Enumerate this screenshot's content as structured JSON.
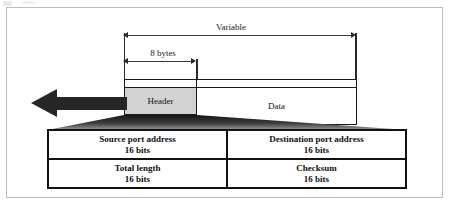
{
  "figure": {
    "type": "udp-user-datagram-format",
    "title": "",
    "dimensions": {
      "variable_label": "Variable",
      "header_length_label": "8 bytes"
    },
    "packet": {
      "header_label": "Header",
      "data_label": "Data",
      "header_fill": "#d2d2d2",
      "data_fill": "#ffffff",
      "border_color": "#1a1a1a"
    },
    "flow_arrow": {
      "direction": "left",
      "color": "#262626"
    },
    "funnel": {
      "fill_top": "#1c1c1c",
      "fill_bottom": "#8f8f8f"
    },
    "header_fields": {
      "rows": [
        {
          "cells": [
            {
              "name": "Source port address",
              "size": "16 bits"
            },
            {
              "name": "Destination port address",
              "size": "16 bits"
            }
          ]
        },
        {
          "cells": [
            {
              "name": "Total length",
              "size": "16 bits"
            },
            {
              "name": "Checksum",
              "size": "16 bits"
            }
          ]
        }
      ]
    },
    "frame": {
      "border_color": "#b9bcc2",
      "background": "#ffffff"
    }
  }
}
